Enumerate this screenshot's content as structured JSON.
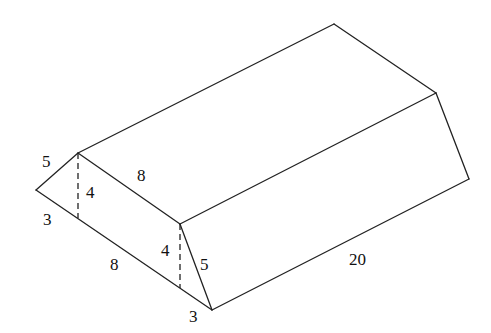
{
  "diagram": {
    "type": "triangular-prism",
    "labels": {
      "left_slant": "5",
      "left_height": "4",
      "left_base": "3",
      "top_face": "8",
      "bottom_face": "8",
      "front_height": "4",
      "front_slant": "5",
      "front_base": "3",
      "length": "20"
    },
    "colors": {
      "line": "#222222",
      "text": "#111111",
      "background": "#ffffff"
    }
  }
}
